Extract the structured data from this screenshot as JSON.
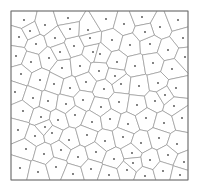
{
  "figure": {
    "title": "",
    "kind": "voronoi-tessellation-diagram",
    "background_color": "#ffffff"
  },
  "chart_data": {
    "type": "scatter",
    "title": "",
    "subtitle": "",
    "xlabel": "",
    "ylabel": "",
    "grid": false,
    "legend": null,
    "annotations": [],
    "xlim": [
      11,
      188
    ],
    "ylim": [
      11,
      180
    ],
    "xticks": [],
    "yticks": [],
    "frame": {
      "x0": 11,
      "y0": 11,
      "x1": 188,
      "y1": 180,
      "stroke": "#6e6e6e",
      "stroke_width": 0.9
    },
    "style": {
      "edge_color": "#8a8a8a",
      "edge_width": 0.6,
      "face_color": "#ffffff",
      "seed_color": "#4a4a4a",
      "seed_radius": 0.9
    },
    "series": [
      {
        "name": "voronoi seed points",
        "marker": "dot",
        "point_count": 100,
        "points": [
          [
            24,
            20
          ],
          [
            45,
            25
          ],
          [
            68,
            18
          ],
          [
            88,
            30
          ],
          [
            106,
            19
          ],
          [
            124,
            24
          ],
          [
            142,
            17
          ],
          [
            160,
            27
          ],
          [
            178,
            20
          ],
          [
            183,
            38
          ],
          [
            19,
            37
          ],
          [
            36,
            44
          ],
          [
            55,
            38
          ],
          [
            74,
            46
          ],
          [
            93,
            52
          ],
          [
            112,
            40
          ],
          [
            130,
            45
          ],
          [
            150,
            44
          ],
          [
            168,
            50
          ],
          [
            185,
            57
          ],
          [
            16,
            56
          ],
          [
            31,
            62
          ],
          [
            49,
            58
          ],
          [
            62,
            68
          ],
          [
            80,
            66
          ],
          [
            99,
            71
          ],
          [
            117,
            62
          ],
          [
            135,
            66
          ],
          [
            153,
            63
          ],
          [
            172,
            69
          ],
          [
            21,
            74
          ],
          [
            40,
            80
          ],
          [
            54,
            84
          ],
          [
            70,
            88
          ],
          [
            86,
            82
          ],
          [
            104,
            89
          ],
          [
            121,
            84
          ],
          [
            139,
            86
          ],
          [
            158,
            83
          ],
          [
            176,
            88
          ],
          [
            15,
            92
          ],
          [
            33,
            98
          ],
          [
            48,
            101
          ],
          [
            66,
            104
          ],
          [
            83,
            100
          ],
          [
            101,
            107
          ],
          [
            119,
            102
          ],
          [
            137,
            105
          ],
          [
            155,
            101
          ],
          [
            174,
            106
          ],
          [
            23,
            111
          ],
          [
            41,
            117
          ],
          [
            58,
            120
          ],
          [
            75,
            115
          ],
          [
            92,
            122
          ],
          [
            110,
            119
          ],
          [
            128,
            124
          ],
          [
            146,
            118
          ],
          [
            164,
            123
          ],
          [
            182,
            118
          ],
          [
            18,
            130
          ],
          [
            35,
            136
          ],
          [
            52,
            133
          ],
          [
            69,
            140
          ],
          [
            87,
            135
          ],
          [
            105,
            141
          ],
          [
            123,
            137
          ],
          [
            141,
            143
          ],
          [
            159,
            138
          ],
          [
            177,
            144
          ],
          [
            26,
            149
          ],
          [
            44,
            154
          ],
          [
            61,
            150
          ],
          [
            78,
            157
          ],
          [
            96,
            152
          ],
          [
            114,
            159
          ],
          [
            132,
            153
          ],
          [
            150,
            160
          ],
          [
            168,
            155
          ],
          [
            184,
            162
          ],
          [
            20,
            168
          ],
          [
            38,
            172
          ],
          [
            56,
            167
          ],
          [
            73,
            174
          ],
          [
            91,
            169
          ],
          [
            109,
            175
          ],
          [
            127,
            170
          ],
          [
            145,
            176
          ],
          [
            163,
            171
          ],
          [
            180,
            175
          ],
          [
            30,
            31
          ],
          [
            60,
            52
          ],
          [
            90,
            38
          ],
          [
            115,
            76
          ],
          [
            145,
            32
          ],
          [
            165,
            95
          ],
          [
            45,
            127
          ],
          [
            100,
            54
          ],
          [
            70,
            29
          ],
          [
            133,
            163
          ]
        ]
      }
    ]
  },
  "elements": {
    "frame_label": "plot border",
    "cells_label": "voronoi cells",
    "seeds_label": "seed points"
  }
}
